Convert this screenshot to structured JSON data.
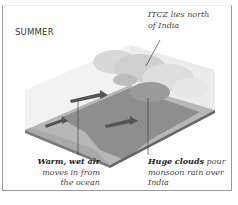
{
  "diagram": {
    "season_label": "SUMMER",
    "annotations": {
      "itcz": {
        "line1": "ITCZ lies north",
        "line2": "of India"
      },
      "warm_air": {
        "bold": "Warm, wet air",
        "line2": "moves in from",
        "line3": "the ocean"
      },
      "clouds": {
        "bold": "Huge clouds",
        "rest1": " pour",
        "line2": "monsoon rain over",
        "line3": "India"
      }
    },
    "icons": [
      "air-flow-arrow",
      "cloud-mass",
      "land-block"
    ],
    "colors": {
      "frame": "#9a9a9a",
      "land": "#8d8d8d",
      "sea": "#b9b9b9",
      "cloud": "#e6e6e6",
      "arrow": "#555555"
    }
  }
}
